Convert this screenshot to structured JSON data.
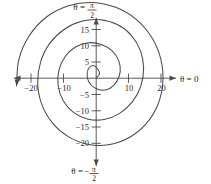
{
  "figure": {
    "name": "polar-spiral-graph",
    "line_color": "#4a4a4a",
    "axis_color": "#4a4a4a",
    "background": "#ffffff"
  },
  "axis_labels": {
    "right": {
      "theta": "θ",
      "equals": " = ",
      "value": "0"
    },
    "top": {
      "theta": "θ",
      "equals": " = ",
      "num": "π",
      "den": "2",
      "sign": ""
    },
    "bottom": {
      "theta": "θ",
      "equals": " = ",
      "num": "π",
      "den": "2",
      "sign": "−"
    }
  },
  "ticks": {
    "x": [
      {
        "label": "−20",
        "value": -20,
        "px": 31
      },
      {
        "label": "−10",
        "value": -10,
        "px": 63.5
      },
      {
        "label": "10",
        "value": 10,
        "px": 128.5
      },
      {
        "label": "20",
        "value": 20,
        "px": 161
      }
    ],
    "y": [
      {
        "label": "15",
        "value": 15,
        "px": 29.5
      },
      {
        "label": "10",
        "value": 10,
        "px": 45.8
      },
      {
        "label": "5",
        "value": 5,
        "px": 62
      },
      {
        "label": "−5",
        "value": -5,
        "px": 94.5
      },
      {
        "label": "−10",
        "value": -10,
        "px": 110.8
      },
      {
        "label": "−15",
        "value": -15,
        "px": 127
      },
      {
        "label": "−20",
        "value": -20,
        "px": 143.3
      }
    ]
  },
  "chart_data": {
    "type": "line",
    "title": "",
    "subtitle": "",
    "xlabel": "θ = 0",
    "ylabel": "θ = π/2",
    "coordinate_system": "polar-spiral-on-cartesian-axes",
    "curve_name": "archimedean-spiral",
    "equation": "r = aθ",
    "grid": false,
    "legend": null,
    "xlim": [
      -26,
      26
    ],
    "ylim": [
      -26,
      26
    ],
    "xticks": [
      -20,
      -10,
      10,
      20
    ],
    "yticks": [
      15,
      10,
      5,
      -5,
      -10,
      -15,
      -20
    ],
    "polar_angle_labels": [
      "θ = π/2",
      "θ = 0",
      "θ = −π/2"
    ],
    "arrow_end": {
      "x": -22.0,
      "y": -3.0,
      "note": "curve terminates with arrowhead pointing up-left"
    },
    "key_crossings": [
      {
        "axis": "+y",
        "value": 16.0
      },
      {
        "axis": "+x",
        "value": 18.5
      },
      {
        "axis": "-y",
        "value": -21.0
      },
      {
        "axis": "+x inner",
        "value": 7.5
      },
      {
        "axis": "+y inner",
        "value": 4.0
      },
      {
        "axis": "-y inner",
        "value": -9.5
      }
    ],
    "points": [
      {
        "x": 0.0,
        "y": 0.0
      },
      {
        "x": 1.0,
        "y": 1.3
      },
      {
        "x": 0.4,
        "y": 2.9
      },
      {
        "x": -0.9,
        "y": 3.9
      },
      {
        "x": -2.2,
        "y": 3.2
      },
      {
        "x": -2.8,
        "y": 1.3
      },
      {
        "x": -2.3,
        "y": -1.1
      },
      {
        "x": -0.6,
        "y": -2.9
      },
      {
        "x": 1.9,
        "y": -3.7
      },
      {
        "x": 4.4,
        "y": -3.0
      },
      {
        "x": 6.4,
        "y": -0.9
      },
      {
        "x": 7.4,
        "y": 2.1
      },
      {
        "x": 6.9,
        "y": 5.4
      },
      {
        "x": 4.9,
        "y": 8.4
      },
      {
        "x": 1.6,
        "y": 10.4
      },
      {
        "x": -2.4,
        "y": 10.9
      },
      {
        "x": -6.4,
        "y": 9.6
      },
      {
        "x": -9.6,
        "y": 6.6
      },
      {
        "x": -11.5,
        "y": 2.4
      },
      {
        "x": -11.7,
        "y": -2.4
      },
      {
        "x": -10.1,
        "y": -7.0
      },
      {
        "x": -6.9,
        "y": -10.6
      },
      {
        "x": -2.5,
        "y": -12.6
      },
      {
        "x": 2.4,
        "y": -12.7
      },
      {
        "x": 7.1,
        "y": -10.9
      },
      {
        "x": 11.1,
        "y": -7.3
      },
      {
        "x": 13.7,
        "y": -2.5
      },
      {
        "x": 14.6,
        "y": 3.0
      },
      {
        "x": 13.6,
        "y": 8.5
      },
      {
        "x": 10.8,
        "y": 13.2
      },
      {
        "x": 6.5,
        "y": 16.5
      },
      {
        "x": 1.2,
        "y": 18.0
      },
      {
        "x": -4.5,
        "y": 17.5
      },
      {
        "x": -9.9,
        "y": 15.0
      },
      {
        "x": -14.3,
        "y": 10.7
      },
      {
        "x": -17.1,
        "y": 5.0
      },
      {
        "x": -18.0,
        "y": -1.4
      },
      {
        "x": -16.8,
        "y": -7.9
      },
      {
        "x": -13.6,
        "y": -13.6
      },
      {
        "x": -8.7,
        "y": -17.9
      },
      {
        "x": -2.7,
        "y": -20.3
      },
      {
        "x": 3.7,
        "y": -20.5
      },
      {
        "x": 9.9,
        "y": -18.4
      },
      {
        "x": 15.2,
        "y": -14.2
      },
      {
        "x": 18.9,
        "y": -8.3
      },
      {
        "x": 20.5,
        "y": -1.4
      },
      {
        "x": 19.9,
        "y": 5.8
      },
      {
        "x": 17.1,
        "y": 12.5
      },
      {
        "x": 12.3,
        "y": 18.1
      },
      {
        "x": 6.0,
        "y": 21.8
      },
      {
        "x": -1.2,
        "y": 23.3
      },
      {
        "x": -8.5,
        "y": 22.3
      },
      {
        "x": -15.2,
        "y": 18.9
      },
      {
        "x": -20.5,
        "y": 13.2
      },
      {
        "x": -23.8,
        "y": 5.8
      },
      {
        "x": -24.5,
        "y": -2.4
      }
    ]
  }
}
